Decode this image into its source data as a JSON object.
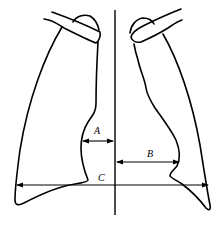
{
  "labels": {
    "a": "A",
    "b": "B",
    "c": "C"
  },
  "measurements": [
    {
      "id": "A",
      "meaning": "right heart border to midline"
    },
    {
      "id": "B",
      "meaning": "midline to left heart border"
    },
    {
      "id": "C",
      "meaning": "maximal internal thoracic width"
    }
  ]
}
